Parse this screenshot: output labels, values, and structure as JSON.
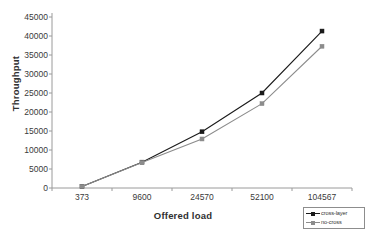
{
  "chart_data": {
    "type": "line",
    "title": "",
    "xlabel": "Offered load",
    "ylabel": "Throughput",
    "categories": [
      "373",
      "9600",
      "24570",
      "52100",
      "104567"
    ],
    "ylim": [
      0,
      45000
    ],
    "yticks": [
      "0",
      "5000",
      "10000",
      "15000",
      "20000",
      "25000",
      "30000",
      "35000",
      "40000",
      "45000"
    ],
    "ytick_values": [
      0,
      5000,
      10000,
      15000,
      20000,
      25000,
      30000,
      35000,
      40000,
      45000
    ],
    "grid": false,
    "legend_position": "bottom-right",
    "series": [
      {
        "name": "cross-layer",
        "color": "#1a1a1a",
        "marker": "square",
        "values": [
          400,
          6800,
          14800,
          25000,
          41300
        ]
      },
      {
        "name": "no-cross",
        "color": "#8c8c8c",
        "marker": "square",
        "values": [
          400,
          6700,
          12900,
          22200,
          37300
        ]
      }
    ]
  },
  "axis": {
    "line_color": "#9a9a9a",
    "tick_color": "#9a9a9a"
  }
}
